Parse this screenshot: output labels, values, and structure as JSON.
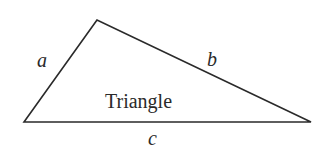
{
  "diagram": {
    "title": "Triangle",
    "vertices": {
      "top": [
        97,
        20
      ],
      "bottom_left": [
        24,
        122
      ],
      "bottom_right": [
        311,
        122
      ]
    },
    "sides": [
      {
        "label": "a",
        "between": [
          "bottom_left",
          "top"
        ]
      },
      {
        "label": "b",
        "between": [
          "top",
          "bottom_right"
        ]
      },
      {
        "label": "c",
        "between": [
          "bottom_left",
          "bottom_right"
        ]
      }
    ],
    "stroke_color": "#2a2a2a",
    "background": "#ffffff"
  }
}
